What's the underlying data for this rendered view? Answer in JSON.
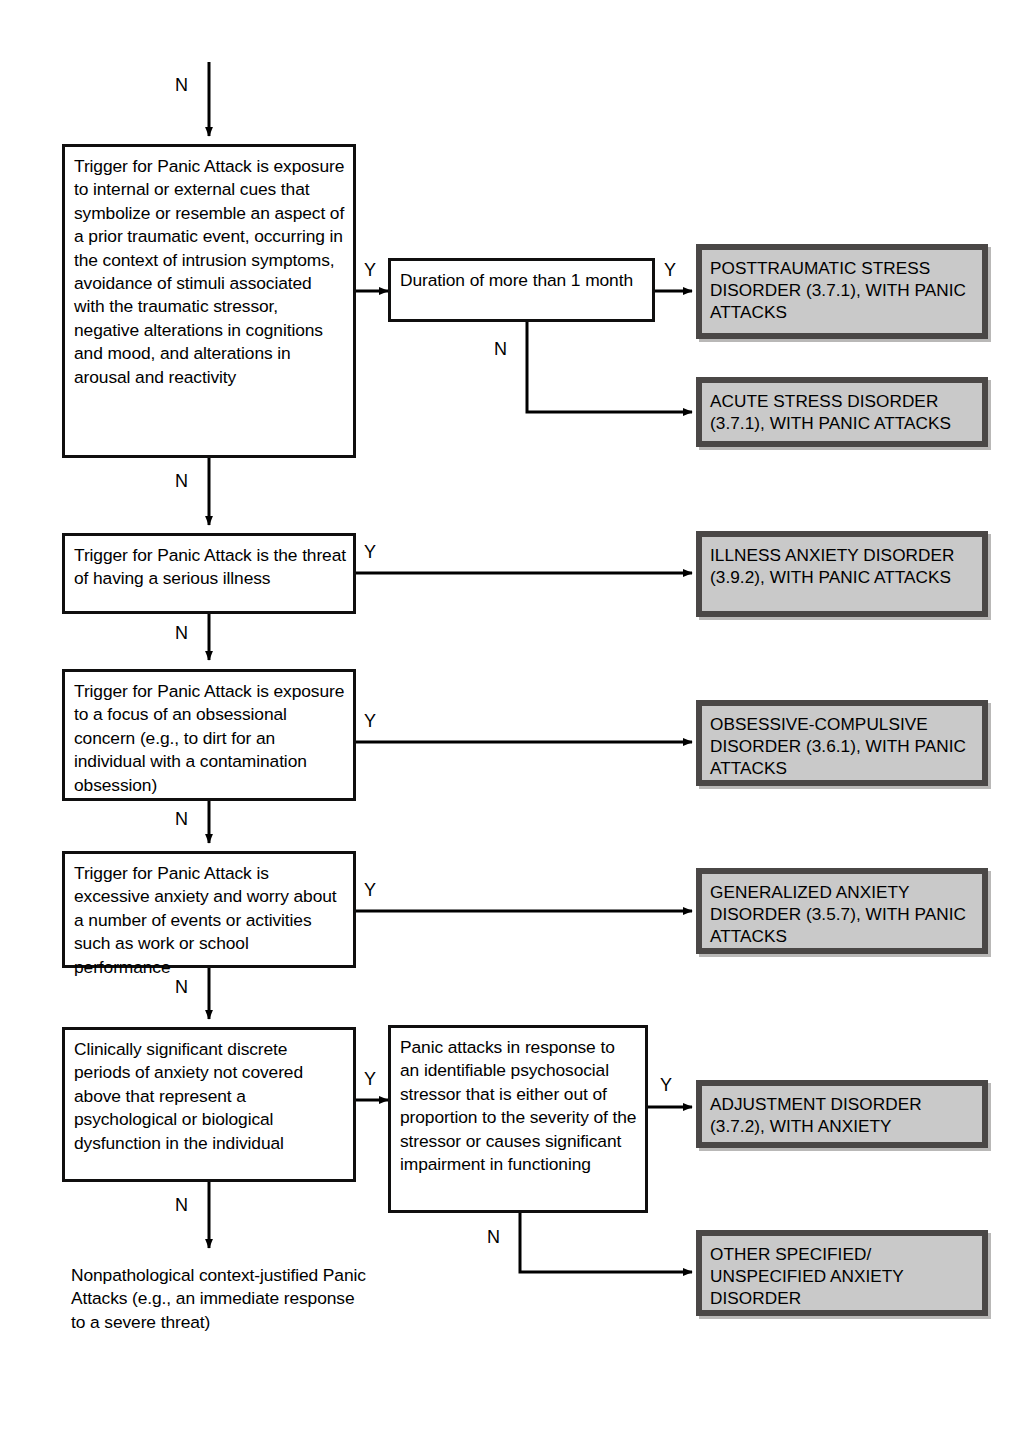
{
  "diagram": {
    "colors": {
      "node_border": "#100f0f",
      "node_fill": "#ffffff",
      "outcome_fill": "#c9c9c9",
      "outcome_border": "#4a4746",
      "outcome_shadow": "#b9b8b7",
      "line": "#000000",
      "text": "#000000"
    },
    "entry": {
      "label": "N"
    },
    "nodes": [
      {
        "id": "ptsd-criterion",
        "kind": "criterion",
        "text": "Trigger for Panic Attack is exposure to internal or external cues that symbolize or resemble an aspect of a prior traumatic event, occurring in the context of intrusion symptoms, avoidance of stimuli associated with the traumatic stressor, negative alterations in cognitions and mood, and alterations in arousal and reactivity"
      },
      {
        "id": "duration-criterion",
        "kind": "criterion",
        "text": "Duration of more than 1 month"
      },
      {
        "id": "illness-criterion",
        "kind": "criterion",
        "text": "Trigger for Panic Attack is the threat of having a serious illness"
      },
      {
        "id": "obsession-criterion",
        "kind": "criterion",
        "text": "Trigger for Panic Attack is exposure to a focus of an obsessional concern (e.g., to dirt for an individual with a contamination obsession)"
      },
      {
        "id": "worry-criterion",
        "kind": "criterion",
        "text": "Trigger for Panic Attack is excessive anxiety and worry about a number of events or activities such as work or school performance"
      },
      {
        "id": "clinical-criterion",
        "kind": "criterion",
        "text": "Clinically significant discrete periods of anxiety not covered above that represent a psychological or biological dysfunction in the individual"
      },
      {
        "id": "stressor-criterion",
        "kind": "criterion",
        "text": "Panic attacks in response to an identifiable psychosocial stressor that is either out of proportion to the severity of the stressor or causes significant impairment in functioning"
      }
    ],
    "outcomes": [
      {
        "id": "ptsd-outcome",
        "text": "POSTTRAUMATIC STRESS DISORDER (3.7.1), WITH PANIC ATTACKS"
      },
      {
        "id": "acute-stress-outcome",
        "text": "ACUTE STRESS DISORDER (3.7.1), WITH PANIC ATTACKS"
      },
      {
        "id": "illness-anxiety-outcome",
        "text": "ILLNESS ANXIETY DISORDER (3.9.2), WITH PANIC ATTACKS"
      },
      {
        "id": "ocd-outcome",
        "text": "OBSESSIVE-COMPULSIVE DISORDER (3.6.1), WITH PANIC ATTACKS"
      },
      {
        "id": "gad-outcome",
        "text": "GENERALIZED ANXIETY DISORDER (3.5.7), WITH PANIC ATTACKS"
      },
      {
        "id": "adjustment-outcome",
        "text": "ADJUSTMENT DISORDER (3.7.2), WITH ANXIETY"
      },
      {
        "id": "other-specified-outcome",
        "text": "OTHER SPECIFIED/ UNSPECIFIED ANXIETY DISORDER"
      }
    ],
    "terminal": {
      "id": "nonpathological-terminal",
      "text": "Nonpathological context-justified Panic Attacks (e.g., an immediate response to a severe threat)"
    },
    "edge_labels": {
      "entry_n": "N",
      "ptsd_y": "Y",
      "ptsd_n": "N",
      "duration_y": "Y",
      "duration_n": "N",
      "illness_y": "Y",
      "illness_n": "N",
      "obsession_y": "Y",
      "obsession_n": "N",
      "worry_y": "Y",
      "worry_n": "N",
      "clinical_y": "Y",
      "clinical_n": "N",
      "stressor_y": "Y",
      "stressor_n": "N"
    }
  }
}
